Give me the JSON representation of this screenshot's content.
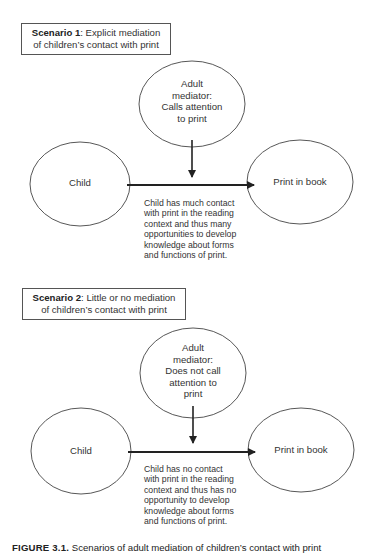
{
  "scenarios": [
    {
      "label_bold": "Scenario 1",
      "label_rest": ": Explicit mediation",
      "label_line2": "of children’s contact with print",
      "mediator": [
        "Adult",
        "mediator:",
        "Calls attention",
        "to print"
      ],
      "child": "Child",
      "target": "Print in book",
      "outcome": [
        "Child has much contact",
        "with print in the reading",
        "context and thus many",
        "opportunities to develop",
        "knowledge about forms",
        "and functions of print."
      ]
    },
    {
      "label_bold": "Scenario 2",
      "label_rest": ": Little or no mediation",
      "label_line2": "of children’s contact with print",
      "mediator": [
        "Adult",
        "mediator:",
        "Does not call",
        "attention to",
        "print"
      ],
      "child": "Child",
      "target": "Print in book",
      "outcome": [
        "Child has no contact",
        "with print in the reading",
        "context and thus has no",
        "opportunity to develop",
        "knowledge about forms",
        "and functions of print."
      ]
    }
  ],
  "caption": {
    "figure": "FIGURE 3.1.",
    "text": "Scenarios of adult mediation of children’s contact with print"
  }
}
